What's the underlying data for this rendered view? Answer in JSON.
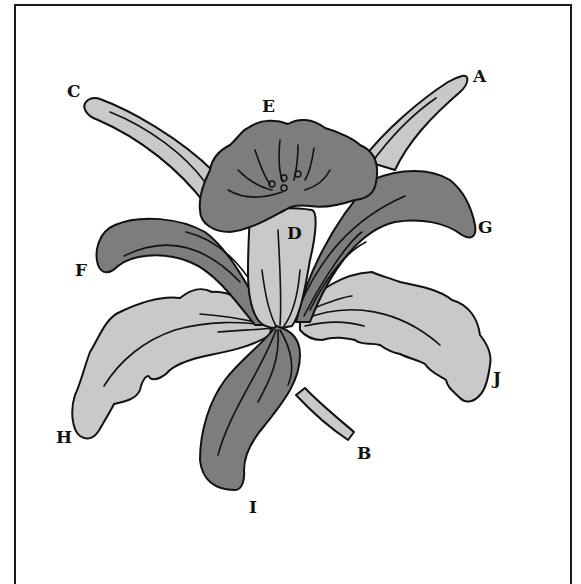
{
  "diagram": {
    "colors": {
      "light_part": "#c9c9c9",
      "dark_part": "#7d7d7d",
      "outline": "#111111",
      "background": "#ffffff"
    },
    "labels": {
      "A": "A",
      "B": "B",
      "C": "C",
      "D": "D",
      "E": "E",
      "F": "F",
      "G": "G",
      "H": "H",
      "I": "I",
      "J": "J"
    }
  }
}
